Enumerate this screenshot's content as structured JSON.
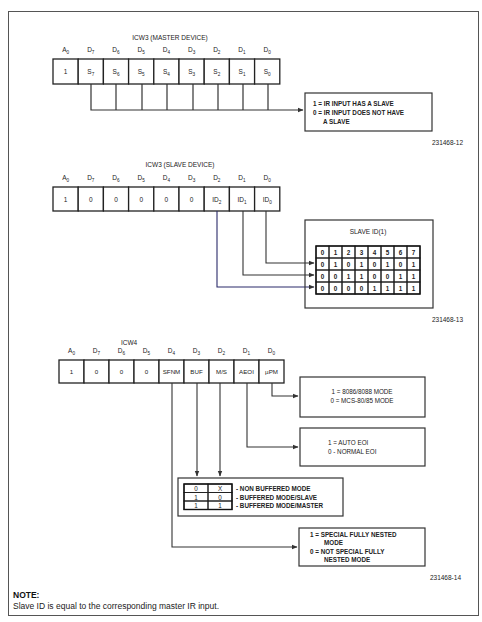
{
  "master": {
    "title": "ICW3 (MASTER DEVICE)",
    "bit_labels": [
      "A0",
      "D7",
      "D6",
      "D5",
      "D4",
      "D3",
      "D2",
      "D1",
      "D0"
    ],
    "cells": [
      "1",
      "S7",
      "S6",
      "S5",
      "S4",
      "S3",
      "S2",
      "S1",
      "S0"
    ],
    "legend": [
      "1 = IR INPUT HAS A SLAVE",
      "0 = IR INPUT DOES NOT HAVE",
      "A SLAVE"
    ],
    "figure_id": "231468-12"
  },
  "slave": {
    "title": "ICW3 (SLAVE DEVICE)",
    "bit_labels": [
      "A0",
      "D7",
      "D6",
      "D5",
      "D4",
      "D3",
      "D2",
      "D1",
      "D0"
    ],
    "cells": [
      "1",
      "0",
      "0",
      "0",
      "0",
      "0",
      "ID2",
      "ID1",
      "ID0"
    ],
    "id_box_title": "SLAVE ID(1)",
    "id_table": [
      [
        "0",
        "1",
        "2",
        "3",
        "4",
        "5",
        "6",
        "7"
      ],
      [
        "0",
        "1",
        "0",
        "1",
        "0",
        "1",
        "0",
        "1"
      ],
      [
        "0",
        "0",
        "1",
        "1",
        "0",
        "0",
        "1",
        "1"
      ],
      [
        "0",
        "0",
        "0",
        "0",
        "1",
        "1",
        "1",
        "1"
      ]
    ],
    "figure_id": "231468-13"
  },
  "icw4": {
    "title": "ICW4",
    "bit_labels": [
      "A0",
      "D7",
      "D6",
      "D5",
      "D4",
      "D3",
      "D2",
      "D1",
      "D0"
    ],
    "cells": [
      "1",
      "0",
      "0",
      "0",
      "SFNM",
      "BUF",
      "M/S",
      "AEOI",
      "µPM"
    ],
    "upm_legend": [
      "1 = 8086/8088 MODE",
      "0 = MCS-80/85 MODE"
    ],
    "aeoi_legend": [
      "1 = AUTO EOI",
      "0 - NORMAL EOI"
    ],
    "buf_table": [
      {
        "buf": "0",
        "ms": "X",
        "desc": "- NON BUFFERED MODE"
      },
      {
        "buf": "1",
        "ms": "0",
        "desc": "- BUFFERED MODE/SLAVE"
      },
      {
        "buf": "1",
        "ms": "1",
        "desc": "- BUFFERED MODE/MASTER"
      }
    ],
    "sfnm_legend": [
      "1 = SPECIAL FULLY NESTED",
      "MODE",
      "0 = NOT SPECIAL FULLY",
      "NESTED MODE"
    ],
    "figure_id": "231468-14"
  },
  "note": {
    "title": "NOTE:",
    "text": "Slave ID is equal to the corresponding master IR input."
  }
}
